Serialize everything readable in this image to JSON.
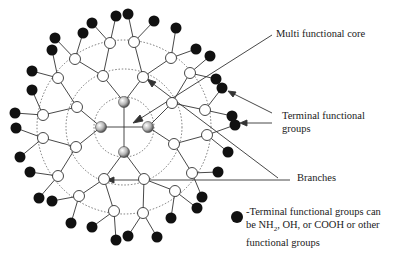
{
  "labels": {
    "core": "Multi functional core",
    "terminal_line1": "Terminal functional",
    "terminal_line2": "groups",
    "branches": "Branches"
  },
  "legend": {
    "symbol": "black-filled-circle",
    "line1": "-Terminal functional groups can",
    "line2_pre": "be NH",
    "line2_sub": "2",
    "line2_post": ", OH, or COOH or other",
    "line3": "functional groups"
  },
  "colors": {
    "terminal": "#111111",
    "branch_node_fill": "#ffffff",
    "core_fill": "#bdbdbd",
    "line": "#333333"
  }
}
